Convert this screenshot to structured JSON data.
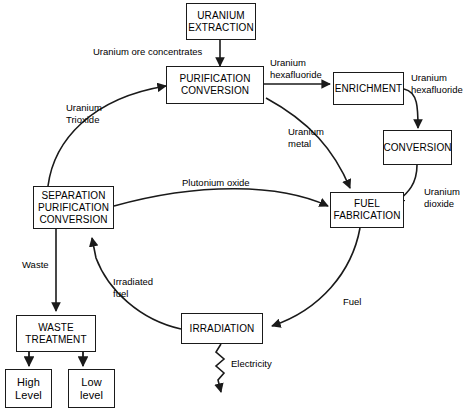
{
  "diagram": {
    "background_color": "#ffffff",
    "line_color": "#1a1a1a",
    "nodes": [
      {
        "id": "uranium_extraction",
        "label": "URANIUM\nEXTRACTION"
      },
      {
        "id": "purification_conversion",
        "label": "PURIFICATION\nCONVERSION"
      },
      {
        "id": "enrichment",
        "label": "ENRICHMENT"
      },
      {
        "id": "conversion",
        "label": "CONVERSION"
      },
      {
        "id": "fuel_fabrication",
        "label": "FUEL\nFABRICATION"
      },
      {
        "id": "separation_purification_conversion",
        "label": "SEPARATION\nPURIFICATION\nCONVERSION"
      },
      {
        "id": "irradiation",
        "label": "IRRADIATION"
      },
      {
        "id": "waste_treatment",
        "label": "WASTE\nTREATMENT"
      },
      {
        "id": "high_level",
        "label": "High\nLevel"
      },
      {
        "id": "low_level",
        "label": "Low\nlevel"
      }
    ],
    "edge_labels": [
      {
        "id": "ore_concentrates",
        "text": "Uranium ore concentrates"
      },
      {
        "id": "uranium_hexafluoride_1",
        "text": "Uranium\nhexafluoride"
      },
      {
        "id": "uranium_hexafluoride_2",
        "text": "Uranium\nhexafluoride"
      },
      {
        "id": "uranium_dioxide",
        "text": "Uranium\ndioxide"
      },
      {
        "id": "uranium_trioxide",
        "text": "Uranium\nTrioxide"
      },
      {
        "id": "uranium_metal",
        "text": "Uranium\nmetal"
      },
      {
        "id": "plutonium_oxide",
        "text": "Plutonium oxide"
      },
      {
        "id": "waste",
        "text": "Waste"
      },
      {
        "id": "irradiated_fuel",
        "text": "Irradiated\nfuel"
      },
      {
        "id": "fuel",
        "text": "Fuel"
      },
      {
        "id": "electricity",
        "text": "Electricity"
      }
    ]
  }
}
